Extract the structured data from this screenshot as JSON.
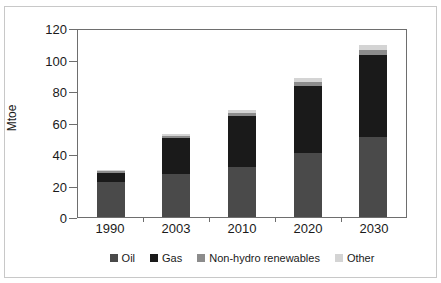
{
  "top_caption": "",
  "chart_data": {
    "type": "bar",
    "stacked": true,
    "title": "",
    "xlabel": "",
    "ylabel": "Mtoe",
    "ylim": [
      0,
      120
    ],
    "ytick_step": 20,
    "yticks": [
      0,
      20,
      40,
      60,
      80,
      100,
      120
    ],
    "grid": false,
    "legend_position": "bottom",
    "categories": [
      "1990",
      "2003",
      "2010",
      "2020",
      "2030"
    ],
    "series": [
      {
        "name": "Oil",
        "color": "#4a4a4a",
        "values": [
          22,
          27,
          32,
          40.5,
          51
        ]
      },
      {
        "name": "Gas",
        "color": "#1a1a1a",
        "values": [
          6,
          23,
          32,
          42.5,
          52
        ]
      },
      {
        "name": "Non-hydro renewables",
        "color": "#8c8c8c",
        "values": [
          1,
          1.5,
          2,
          2.5,
          3
        ]
      },
      {
        "name": "Other",
        "color": "#d4d4d4",
        "values": [
          1,
          1,
          2,
          2.5,
          3
        ]
      }
    ],
    "totals": [
      30,
      52.5,
      68,
      88,
      109
    ]
  },
  "legend": {
    "items": [
      {
        "label": "Oil",
        "color": "#4a4a4a"
      },
      {
        "label": "Gas",
        "color": "#1a1a1a"
      },
      {
        "label": "Non-hydro renewables",
        "color": "#8c8c8c"
      },
      {
        "label": "Other",
        "color": "#d4d4d4"
      }
    ]
  },
  "colors": {
    "axis": "#6e6e6e",
    "frame": "#c8c8c8",
    "text": "#1a1a1a",
    "background": "#ffffff"
  }
}
